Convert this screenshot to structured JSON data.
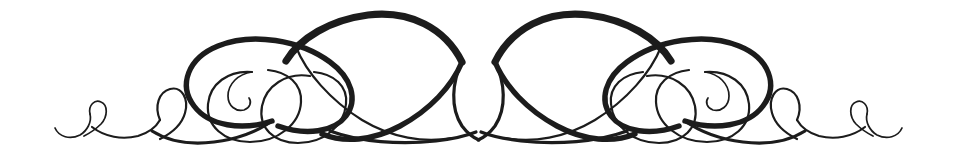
{
  "canvas": {
    "width": 957,
    "height": 159,
    "background_color": "#ffffff",
    "ink_color": "#1c1c1c",
    "alt_text": "Symmetrical calligraphic flourish ornament"
  },
  "ornament": {
    "name": "calligraphic-flourish-divider",
    "style": "copperplate-swash",
    "symmetry": "bilateral-mirror-about-vertical-center",
    "center_x": 478.5,
    "baseline_y": 140,
    "apex_y": 13,
    "left_tip_x": 55,
    "right_tip_x": 902,
    "stroke_weights": {
      "hairline": 1.7,
      "thin": 2.2,
      "medium": 3.2,
      "bold": 5.4,
      "extra_bold": 7.2
    },
    "elements": [
      {
        "id": "tail-left",
        "label": "left hairline tail"
      },
      {
        "id": "small-loop-left",
        "label": "left small teardrop loop"
      },
      {
        "id": "mid-loop-left",
        "label": "left medium teardrop loop"
      },
      {
        "id": "outer-oval-left",
        "label": "left large bold oval"
      },
      {
        "id": "inner-oval-left",
        "label": "left inner thin oval"
      },
      {
        "id": "spiral-left",
        "label": "left inward spiral curl terminal"
      },
      {
        "id": "grand-arc-left",
        "label": "left grand sweeping arc"
      },
      {
        "id": "center-vesica",
        "label": "central pointed oval crossing"
      },
      {
        "id": "grand-arc-right",
        "label": "right grand sweeping arc"
      },
      {
        "id": "spiral-right",
        "label": "right inward spiral curl terminal"
      },
      {
        "id": "inner-oval-right",
        "label": "right inner thin oval"
      },
      {
        "id": "outer-oval-right",
        "label": "right large bold oval"
      },
      {
        "id": "mid-loop-right",
        "label": "right medium teardrop loop"
      },
      {
        "id": "small-loop-right",
        "label": "right small teardrop loop"
      },
      {
        "id": "tail-right",
        "label": "right hairline tail"
      }
    ]
  }
}
